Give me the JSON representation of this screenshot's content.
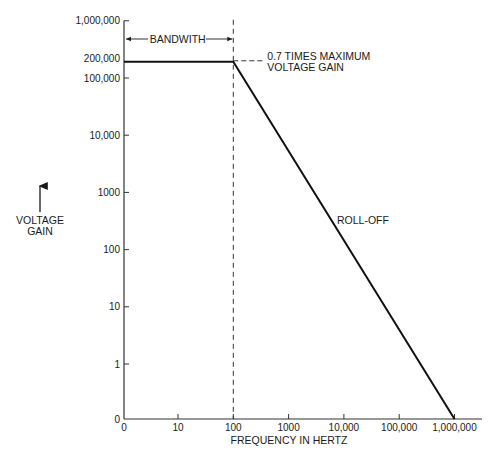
{
  "chart_data": {
    "type": "line",
    "title": "",
    "xlabel": "FREQUENCY IN HERTZ",
    "ylabel": [
      "VOLTAGE",
      "GAIN"
    ],
    "x_scale": "log",
    "y_scale": "log",
    "grid": false,
    "legend": "none",
    "x_ticks": [
      {
        "value": 0,
        "label": "0"
      },
      {
        "value": 10,
        "label": "10"
      },
      {
        "value": 100,
        "label": "100"
      },
      {
        "value": 1000,
        "label": "1000"
      },
      {
        "value": 10000,
        "label": "10,000"
      },
      {
        "value": 100000,
        "label": "100,000"
      },
      {
        "value": 1000000,
        "label": "1,000,000"
      }
    ],
    "y_ticks": [
      {
        "value": 0,
        "label": "0"
      },
      {
        "value": 1,
        "label": "1"
      },
      {
        "value": 10,
        "label": "10"
      },
      {
        "value": 100,
        "label": "100"
      },
      {
        "value": 1000,
        "label": "1000"
      },
      {
        "value": 10000,
        "label": "10,000"
      },
      {
        "value": 100000,
        "label": "100,000"
      },
      {
        "value": 1000000,
        "label": "1,000,000"
      }
    ],
    "y_extra_label": {
      "value": 200000,
      "label": "200,000"
    },
    "xlim": [
      0,
      1000000
    ],
    "ylim": [
      0,
      1000000
    ],
    "series": [
      {
        "name": "Voltage gain response",
        "points": [
          {
            "x": 0,
            "y": 200000
          },
          {
            "x": 100,
            "y": 200000
          },
          {
            "x": 1000000,
            "y": 0
          }
        ]
      }
    ],
    "annotations": {
      "bandwidth_label": "BANDWITH",
      "bandwidth_range": [
        0,
        100
      ],
      "cutoff_frequency": 100,
      "cutoff_label_line1": "0.7 TIMES MAXIMUM",
      "cutoff_label_line2": "VOLTAGE GAIN",
      "rolloff_label": "ROLL-OFF"
    }
  }
}
